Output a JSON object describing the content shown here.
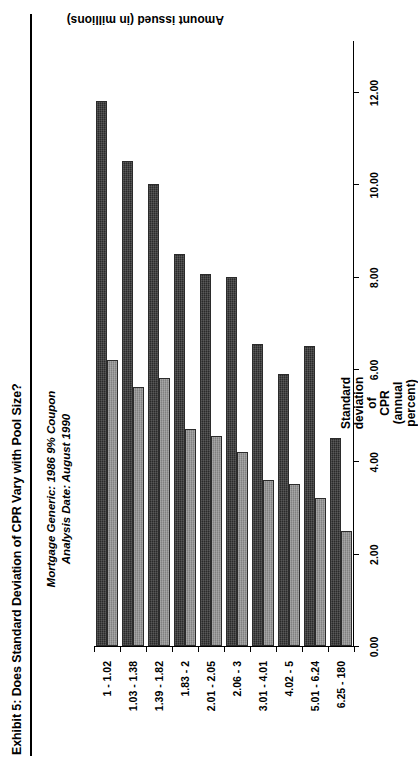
{
  "exhibit": {
    "title": "Exhibit 5: Does Standard Deviation of CPR Vary with Pool Size?",
    "subtitle_line1": "Mortgage Generic: 1986 9% Coupon",
    "subtitle_line2": "Analysis Date: August 1990"
  },
  "axis_title": {
    "value_axis_line1": "Standard",
    "value_axis_line2": "deviation",
    "value_axis_line3": "of",
    "value_axis_line4": "CPR",
    "value_axis_line5": "(annual",
    "value_axis_line6": "percent)",
    "category_axis": "Amount issued (in millions)"
  },
  "chart_data": {
    "type": "bar",
    "title": "Exhibit 5: Does Standard Deviation of CPR Vary with Pool Size?",
    "subtitle": "Mortgage Generic: 1986 9% Coupon / Analysis Date: August 1990",
    "xlabel": "Amount issued (in millions)",
    "ylabel": "Standard deviation of CPR (annual percent)",
    "orientation": "horizontal",
    "grid": false,
    "legend": "none",
    "ylim": [
      0.0,
      12.0
    ],
    "ytick_labels": [
      "0.00",
      "2.00",
      "4.00",
      "6.00",
      "8.00",
      "10.00",
      "12.00"
    ],
    "ytick_values": [
      0.0,
      2.0,
      4.0,
      6.0,
      8.0,
      10.0,
      12.0
    ],
    "categories": [
      "1 - 1.02",
      "1.03 - 1.38",
      "1.39 - 1.82",
      "1.83 - 2",
      "2.01 - 2.05",
      "2.06 - 3",
      "3.01 - 4.01",
      "4.02 - 5",
      "5.01 - 6.24",
      "6.25 - 180"
    ],
    "series": [
      {
        "name": "dark",
        "color": "#2a2a2a",
        "values": [
          11.8,
          10.5,
          10.0,
          8.5,
          8.05,
          8.0,
          6.55,
          5.9,
          6.5,
          4.5
        ]
      },
      {
        "name": "light",
        "color": "#8e8e8e",
        "values": [
          6.2,
          5.6,
          5.8,
          4.7,
          4.55,
          4.2,
          3.6,
          3.5,
          3.2,
          2.5
        ]
      }
    ]
  }
}
